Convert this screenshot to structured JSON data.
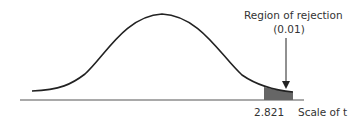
{
  "figure": {
    "annotation_line1": "Region of rejection",
    "annotation_line2": "(0.01)",
    "critical_value": "2.821",
    "axis_label": "Scale of t"
  },
  "colors": {
    "curve": "#222222",
    "baseline": "#555555",
    "shaded_region": "#666666"
  }
}
